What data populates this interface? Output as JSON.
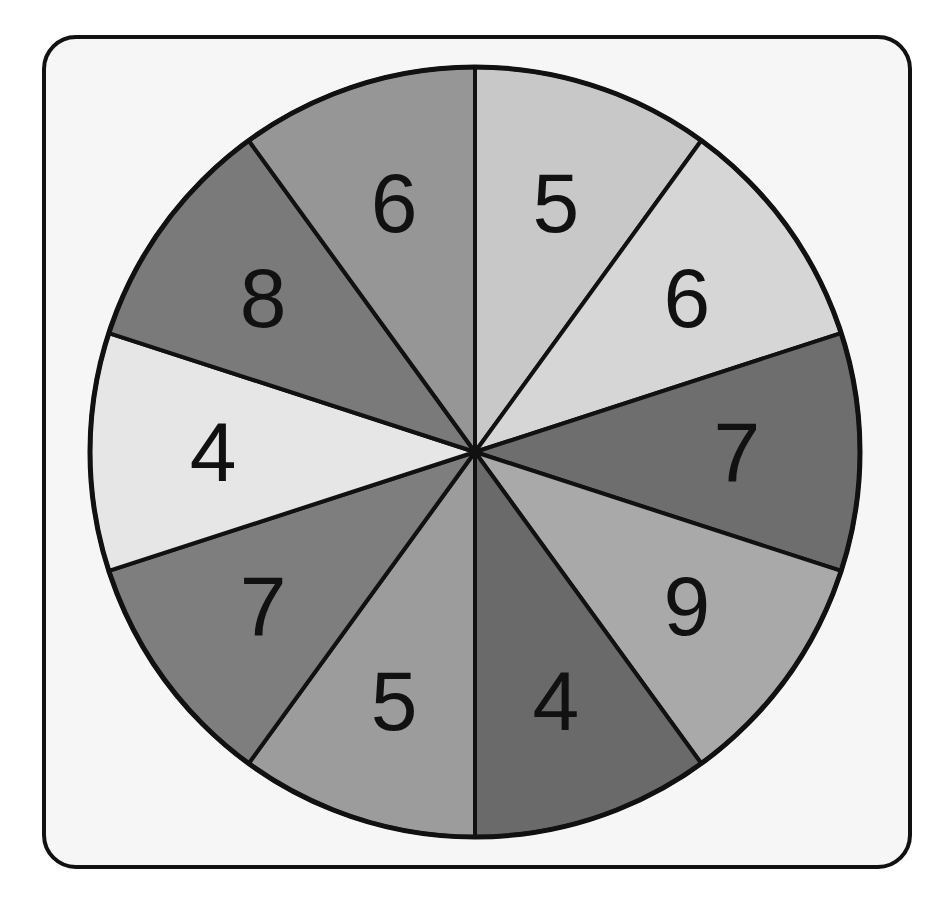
{
  "spinner": {
    "title": "Spinner",
    "center": [
      475,
      452
    ],
    "radius": 385,
    "sectors": [
      {
        "label": "5",
        "color": "#c8c8c8"
      },
      {
        "label": "6",
        "color": "#d6d6d6"
      },
      {
        "label": "7",
        "color": "#6e6e6e"
      },
      {
        "label": "9",
        "color": "#a9a9a9"
      },
      {
        "label": "4",
        "color": "#6a6a6a"
      },
      {
        "label": "5",
        "color": "#9c9c9c"
      },
      {
        "label": "7",
        "color": "#7e7e7e"
      },
      {
        "label": "4",
        "color": "#e6e6e6"
      },
      {
        "label": "8",
        "color": "#7a7a7a"
      },
      {
        "label": "6",
        "color": "#969696"
      }
    ]
  },
  "colors": {
    "frame_border": "#111111",
    "frame_fill": "#f6f6f6",
    "outline": "#111111"
  }
}
